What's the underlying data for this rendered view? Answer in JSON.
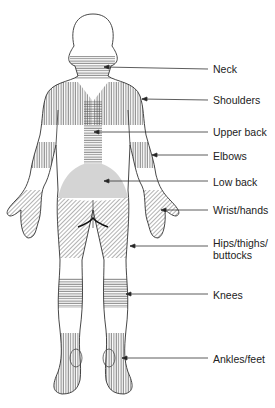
{
  "colors": {
    "outline": "#333333",
    "hatch": "#555555",
    "low_back_fill": "#d4d4d4",
    "text": "#222222"
  },
  "labels": [
    {
      "id": "neck",
      "text": "Neck",
      "y": 63,
      "arrow_to_x": 104
    },
    {
      "id": "shoulders",
      "text": "Shoulders",
      "y": 94,
      "arrow_to_x": 142
    },
    {
      "id": "upper-back",
      "text": "Upper back",
      "y": 126,
      "arrow_to_x": 94
    },
    {
      "id": "elbows",
      "text": "Elbows",
      "y": 150,
      "arrow_to_x": 152
    },
    {
      "id": "low-back",
      "text": "Low back",
      "y": 176,
      "arrow_to_x": 104
    },
    {
      "id": "wrist-hands",
      "text": "Wrist/hands",
      "y": 207,
      "arrow_to_x": 161
    },
    {
      "id": "hips-thighs-buttocks",
      "text": "Hips/thighs/ buttocks",
      "y": 246,
      "arrow_to_x": 130
    },
    {
      "id": "knees",
      "text": "Knees",
      "y": 294,
      "arrow_to_x": 126
    },
    {
      "id": "ankles-feet",
      "text": "Ankles/feet",
      "y": 358,
      "arrow_to_x": 122
    }
  ]
}
